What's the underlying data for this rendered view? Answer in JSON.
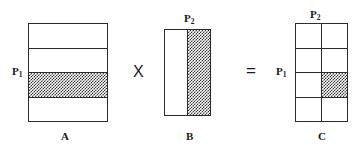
{
  "figure": {
    "type": "matrix-multiplication-diagram",
    "ink_color": "#2b2b2b",
    "shade_color": "#3a3a3a",
    "background": "#ffffff"
  },
  "operators": {
    "times": "X",
    "equals": "="
  },
  "matrices": [
    {
      "id": "A",
      "caption": "A",
      "rows": 4,
      "cols": 1,
      "orientation": "rows",
      "shaded_row": 3,
      "shaded_col": null,
      "row_label": "P",
      "row_label_sub": "1",
      "col_label": null,
      "col_label_sub": null
    },
    {
      "id": "B",
      "caption": "B",
      "rows": 1,
      "cols": 2,
      "orientation": "cols",
      "shaded_row": null,
      "shaded_col": 2,
      "row_label": null,
      "row_label_sub": null,
      "col_label": "P",
      "col_label_sub": "2"
    },
    {
      "id": "C",
      "caption": "C",
      "rows": 4,
      "cols": 2,
      "orientation": "grid",
      "shaded_row": 3,
      "shaded_col": 2,
      "row_label": "P",
      "row_label_sub": "1",
      "col_label": "P",
      "col_label_sub": "2"
    }
  ],
  "labels": {
    "p1_a": {
      "base": "P",
      "sub": "1"
    },
    "p2_b": {
      "base": "P",
      "sub": "2"
    },
    "p1_c": {
      "base": "P",
      "sub": "1"
    },
    "p2_c": {
      "base": "P",
      "sub": "2"
    },
    "caption_a": "A",
    "caption_b": "B",
    "caption_c": "C"
  }
}
